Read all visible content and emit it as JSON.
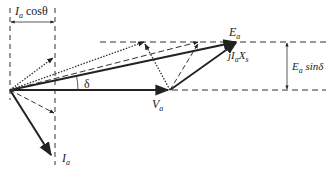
{
  "diagram": {
    "type": "phasor-diagram",
    "labels": {
      "ia_cos_theta": {
        "main": "I",
        "sub": "a",
        "rest": " cosθ"
      },
      "ea": {
        "main": "E",
        "sub": "a"
      },
      "jiaxs": {
        "pre": "jI",
        "sub": "a",
        "main": "X",
        "sub2": "s"
      },
      "ea_sin_delta": {
        "main": "E",
        "sub": "a",
        "rest": " sinδ"
      },
      "delta": "δ",
      "va": {
        "main": "V",
        "sub": "a"
      },
      "ia": {
        "main": "I",
        "sub": "a"
      }
    },
    "colors": {
      "line": "#222222",
      "background": "#ffffff"
    }
  }
}
